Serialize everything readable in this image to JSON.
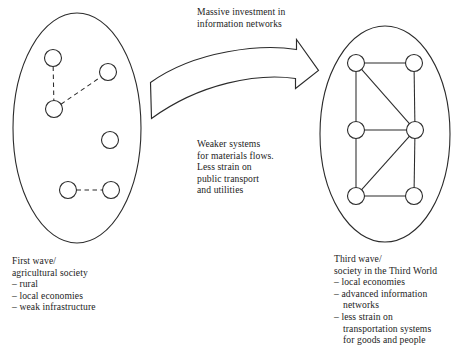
{
  "figure": {
    "type": "conceptual-diagram",
    "stroke_color": "#2b2b2b",
    "background_color": "#ffffff"
  },
  "captions": {
    "transition": {
      "lines": [
        "Massive investment in",
        "information networks"
      ]
    },
    "middle": {
      "lines": [
        "Weaker systems",
        "for materials flows.",
        "Less strain on",
        "public transport",
        "and utilities"
      ]
    },
    "left": {
      "title_lines": [
        "First wave/",
        "agricultural society"
      ],
      "bullets": [
        {
          "lines": [
            "– rural"
          ]
        },
        {
          "lines": [
            "– local economies"
          ]
        },
        {
          "lines": [
            "– weak infrastructure"
          ]
        }
      ]
    },
    "right": {
      "title_lines": [
        "Third wave/",
        "society in the Third World"
      ],
      "bullets": [
        {
          "lines": [
            "– local economies"
          ]
        },
        {
          "lines": [
            "– advanced information",
            "networks"
          ]
        },
        {
          "lines": [
            "– less strain on",
            "transportation systems",
            "for goods and people"
          ]
        }
      ]
    }
  },
  "shapes": {
    "left_ellipse": {
      "cx": 77,
      "cy": 128,
      "rx": 64,
      "ry": 115
    },
    "right_ellipse": {
      "cx": 385,
      "cy": 134,
      "rx": 65,
      "ry": 108
    },
    "node_radius": 8.5,
    "arrow_label": "curved block arrow pointing right"
  },
  "left_network": {
    "link_style": "dashed",
    "nodes": [
      {
        "id": "L1",
        "cx": 53,
        "cy": 58
      },
      {
        "id": "L2",
        "cx": 108,
        "cy": 72
      },
      {
        "id": "L3",
        "cx": 54,
        "cy": 109
      },
      {
        "id": "L4",
        "cx": 110,
        "cy": 140
      },
      {
        "id": "L5",
        "cx": 68,
        "cy": 190
      },
      {
        "id": "L6",
        "cx": 111,
        "cy": 190
      }
    ],
    "edges": [
      {
        "from": "L1",
        "to": "L3"
      },
      {
        "from": "L3",
        "to": "L2"
      },
      {
        "from": "L5",
        "to": "L6"
      }
    ]
  },
  "right_network": {
    "link_style": "solid",
    "nodes": [
      {
        "id": "R1",
        "cx": 356,
        "cy": 63
      },
      {
        "id": "R2",
        "cx": 414,
        "cy": 63
      },
      {
        "id": "R3",
        "cx": 356,
        "cy": 130
      },
      {
        "id": "R4",
        "cx": 415,
        "cy": 130
      },
      {
        "id": "R5",
        "cx": 356,
        "cy": 196
      },
      {
        "id": "R6",
        "cx": 414,
        "cy": 196
      }
    ],
    "edges": [
      {
        "from": "R1",
        "to": "R2"
      },
      {
        "from": "R1",
        "to": "R3"
      },
      {
        "from": "R1",
        "to": "R4"
      },
      {
        "from": "R2",
        "to": "R4"
      },
      {
        "from": "R3",
        "to": "R4"
      },
      {
        "from": "R3",
        "to": "R5"
      },
      {
        "from": "R4",
        "to": "R5"
      },
      {
        "from": "R4",
        "to": "R6"
      },
      {
        "from": "R5",
        "to": "R6"
      }
    ]
  }
}
